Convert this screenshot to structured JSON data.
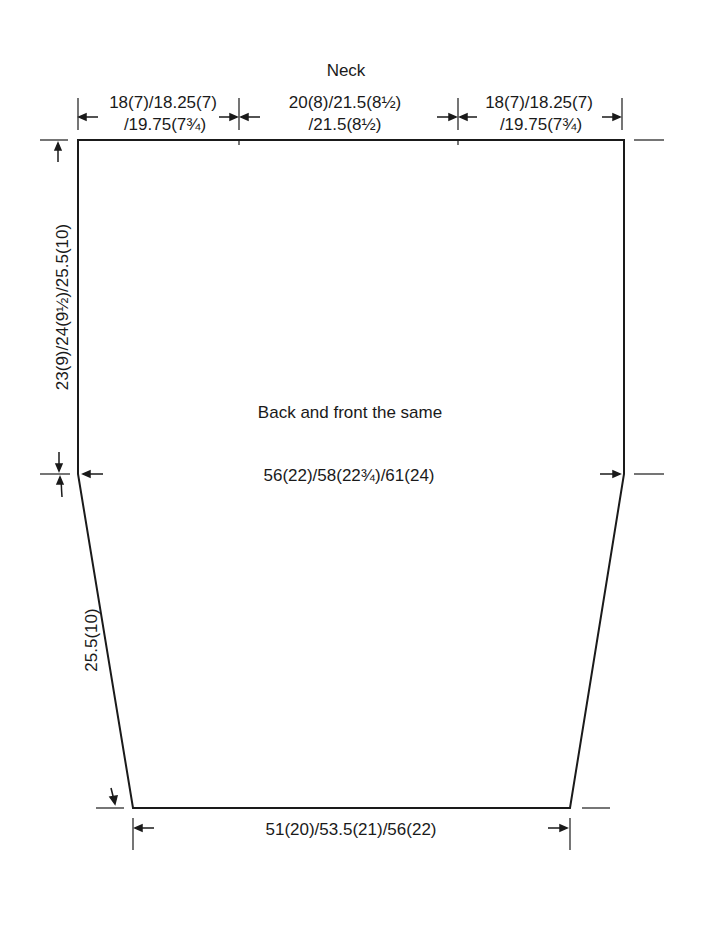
{
  "diagram": {
    "type": "knitting-schematic",
    "neck_label": "Neck",
    "center_label": "Back and front the same",
    "top_left_width": {
      "line1": "18(7)/18.25(7)",
      "line2": "/19.75(7¾)"
    },
    "top_center_width": {
      "line1": "20(8)/21.5(8½)",
      "line2": "/21.5(8½)"
    },
    "top_right_width": {
      "line1": "18(7)/18.25(7)",
      "line2": "/19.75(7¾)"
    },
    "chest_width": "56(22)/58(22¾)/61(24)",
    "armhole_depth": "23(9)/24(9½)/25.5(10)",
    "side_length": "25.5(10)",
    "hem_width": "51(20)/53.5(21)/56(22)",
    "line_color": "#1a1a1a",
    "background": "#ffffff"
  }
}
